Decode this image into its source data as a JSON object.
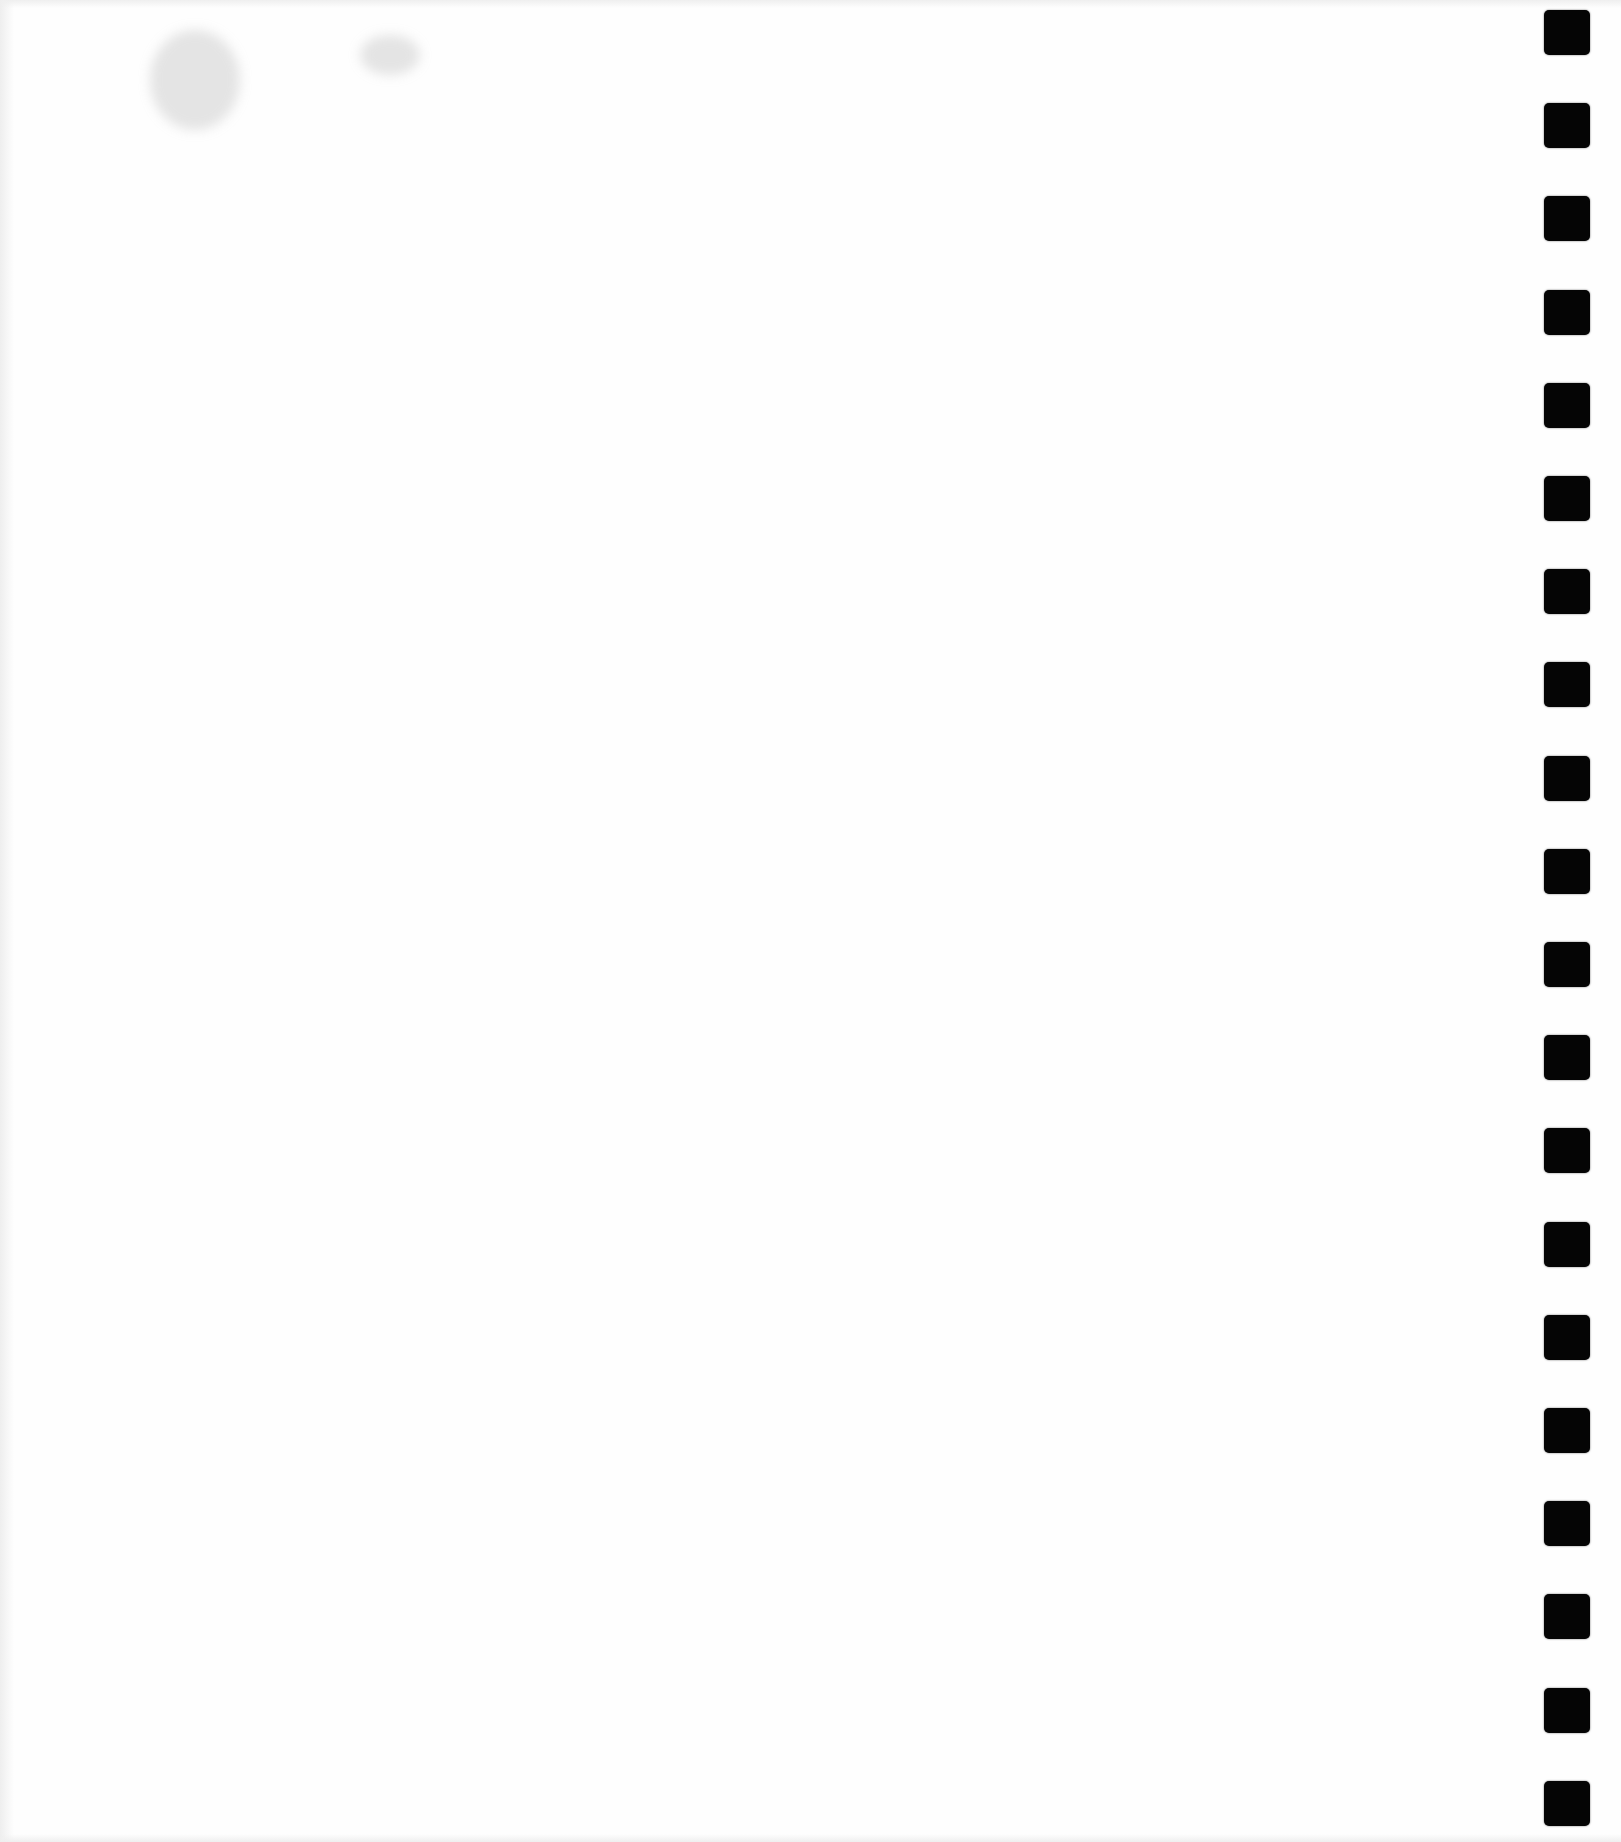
{
  "document": {
    "type": "scanned-blank-page",
    "text_content": "",
    "background_color": "#fefefe"
  },
  "binding": {
    "hole_count": 20,
    "hole_color": "#050505",
    "hole_size_px": 45,
    "hole_pitch_px": 93.2,
    "first_hole_top_px": 10,
    "position": "right-edge"
  }
}
